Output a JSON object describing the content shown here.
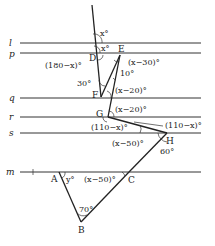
{
  "diagram": {
    "type": "geometry",
    "parallel_lines": [
      {
        "name": "l",
        "y": 43
      },
      {
        "name": "p",
        "y": 53
      },
      {
        "name": "q",
        "y": 98
      },
      {
        "name": "r",
        "y": 117
      },
      {
        "name": "s",
        "y": 133
      },
      {
        "name": "m",
        "y": 172
      }
    ],
    "points": {
      "A": {
        "label": "A",
        "x": 59,
        "y": 172
      },
      "B": {
        "label": "B",
        "x": 81,
        "y": 222
      },
      "C": {
        "label": "C",
        "x": 129,
        "y": 172
      },
      "D": {
        "label": "D",
        "x": 98,
        "y": 55
      },
      "E": {
        "label": "E",
        "x": 120,
        "y": 55
      },
      "F": {
        "label": "F",
        "x": 101,
        "y": 97
      },
      "G": {
        "label": "G",
        "x": 108,
        "y": 117
      },
      "H": {
        "label": "H",
        "x": 167,
        "y": 133
      }
    },
    "angles": {
      "top_x": "x°",
      "l_x": "x°",
      "d_angle": "(180−x)°",
      "e_angle": "(x−30)°",
      "ten": "10°",
      "thirty": "30°",
      "f_angle": "(x−20)°",
      "g_angle": "(x−20)°",
      "r_angle": "(110−x)°",
      "s_angle": "(110−x)°",
      "h_angle": "(x−50)°",
      "sixty": "60°",
      "a_angle": "y°",
      "c_angle": "(x−50)°",
      "b_angle": "70°"
    }
  }
}
